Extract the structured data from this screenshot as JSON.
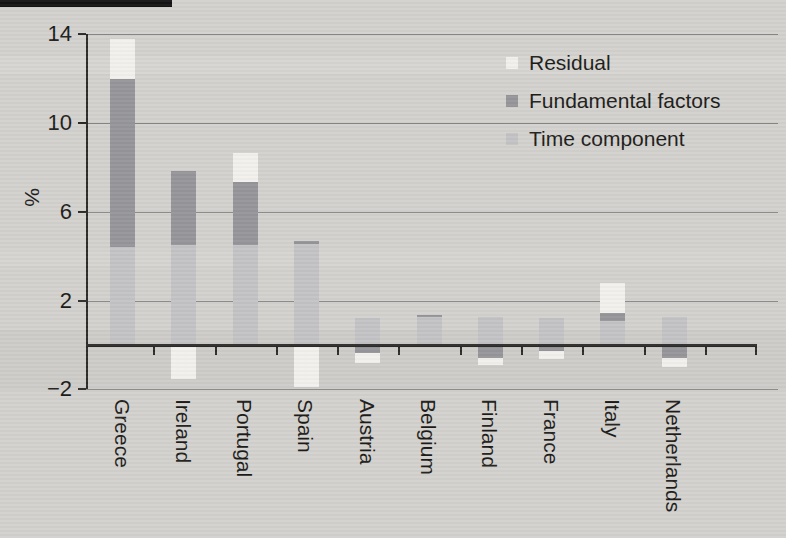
{
  "figure": {
    "background_color": "#d2d1cd",
    "scan_mark_color": "#141414",
    "text_color": "#1d1c1a",
    "gridline_color": "#87878a",
    "axis_color": "#2c2b29"
  },
  "chart_data": {
    "type": "bar",
    "stacked": true,
    "title": "",
    "xlabel": "",
    "ylabel": "%",
    "ylim": [
      -2,
      14
    ],
    "yticks": [
      14,
      10,
      6,
      2,
      -2
    ],
    "ytick_labels": [
      "14",
      "10",
      "6",
      "2",
      "−2"
    ],
    "grid": true,
    "legend_position": "top-right",
    "legend_order": [
      "Residual",
      "Fundamental factors",
      "Time component"
    ],
    "categories": [
      "Greece",
      "Ireland",
      "Portugal",
      "Spain",
      "Austria",
      "Belgium",
      "Finland",
      "France",
      "Italy",
      "Netherlands"
    ],
    "series": [
      {
        "name": "Time component",
        "color": "#c3c3c5",
        "values": [
          4.4,
          4.5,
          4.5,
          4.55,
          1.2,
          1.25,
          1.25,
          1.2,
          1.1,
          1.25
        ]
      },
      {
        "name": "Fundamental factors",
        "color": "#95959a",
        "values": [
          7.6,
          3.35,
          2.85,
          0.15,
          -0.35,
          0.1,
          -0.6,
          -0.25,
          0.35,
          -0.6
        ]
      },
      {
        "name": "Residual",
        "color": "#f1f0ec",
        "values": [
          1.8,
          -1.55,
          1.3,
          -1.9,
          -0.45,
          0,
          -0.3,
          -0.4,
          1.35,
          -0.4
        ]
      }
    ]
  }
}
